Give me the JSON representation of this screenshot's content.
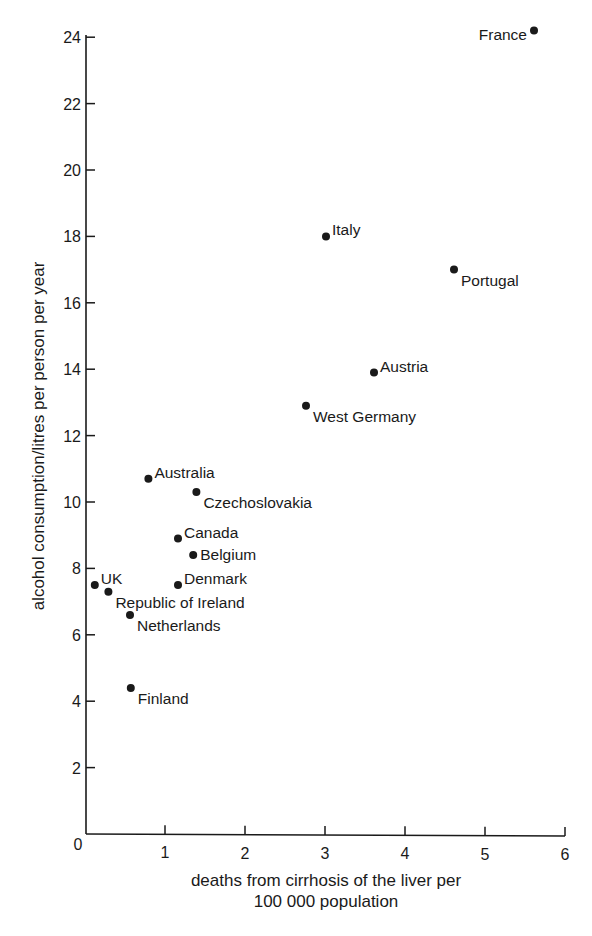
{
  "chart_data": {
    "type": "scatter",
    "title": "",
    "xlabel": "deaths from cirrhosis of the liver per 100 000 population",
    "xlabel_lines": [
      "deaths from cirrhosis of the liver per",
      "100 000 population"
    ],
    "ylabel": "alcohol consumption/litres per person per year",
    "xlim": [
      0,
      6
    ],
    "ylim": [
      0,
      24
    ],
    "xticks": [
      1,
      2,
      3,
      4,
      5,
      6
    ],
    "yticks": [
      2,
      4,
      6,
      8,
      10,
      12,
      14,
      16,
      18,
      20,
      22,
      24
    ],
    "origin_label": "0",
    "grid": false,
    "legend": null,
    "points": [
      {
        "label": "France",
        "x": 5.6,
        "y": 24.2,
        "label_pos": "left"
      },
      {
        "label": "Italy",
        "x": 3.0,
        "y": 18.0,
        "label_pos": "right-up"
      },
      {
        "label": "Portugal",
        "x": 4.6,
        "y": 17.0,
        "label_pos": "right-down"
      },
      {
        "label": "Austria",
        "x": 3.6,
        "y": 13.9,
        "label_pos": "right-up"
      },
      {
        "label": "West Germany",
        "x": 2.75,
        "y": 12.9,
        "label_pos": "right-down"
      },
      {
        "label": "Australia",
        "x": 0.78,
        "y": 10.7,
        "label_pos": "right-up"
      },
      {
        "label": "Czechoslovakia",
        "x": 1.38,
        "y": 10.3,
        "label_pos": "right-down"
      },
      {
        "label": "Canada",
        "x": 1.15,
        "y": 8.9,
        "label_pos": "right-up"
      },
      {
        "label": "Belgium",
        "x": 1.34,
        "y": 8.4,
        "label_pos": "right"
      },
      {
        "label": "UK",
        "x": 0.11,
        "y": 7.5,
        "label_pos": "right-up"
      },
      {
        "label": "Denmark",
        "x": 1.15,
        "y": 7.5,
        "label_pos": "right-up"
      },
      {
        "label": "Republic of Ireland",
        "x": 0.28,
        "y": 7.3,
        "label_pos": "right-down"
      },
      {
        "label": "Netherlands",
        "x": 0.55,
        "y": 6.6,
        "label_pos": "right-down"
      },
      {
        "label": "Finland",
        "x": 0.56,
        "y": 4.4,
        "label_pos": "right-down"
      }
    ]
  },
  "colors": {
    "ink": "#1a1a1a",
    "background": "#ffffff"
  }
}
